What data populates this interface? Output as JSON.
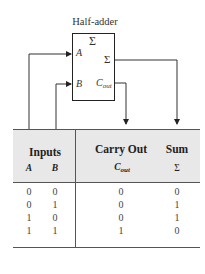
{
  "diagram": {
    "title": "Half-adder",
    "block_symbol": "Σ",
    "inputs": [
      {
        "name": "A"
      },
      {
        "name": "B"
      }
    ],
    "outputs": [
      {
        "name": "Σ"
      },
      {
        "name": "C",
        "subscript": "out"
      }
    ]
  },
  "truth_table": {
    "group_headers": [
      "Inputs",
      "Carry Out",
      "Sum"
    ],
    "column_headers": [
      {
        "main": "A",
        "sub": ""
      },
      {
        "main": "B",
        "sub": ""
      },
      {
        "main": "C",
        "sub": "out"
      },
      {
        "main": "Σ",
        "sub": ""
      }
    ],
    "rows": [
      [
        "0",
        "0",
        "0",
        "0"
      ],
      [
        "0",
        "1",
        "0",
        "1"
      ],
      [
        "1",
        "0",
        "0",
        "1"
      ],
      [
        "1",
        "1",
        "1",
        "0"
      ]
    ],
    "header_bg": "#e8e8e8"
  }
}
